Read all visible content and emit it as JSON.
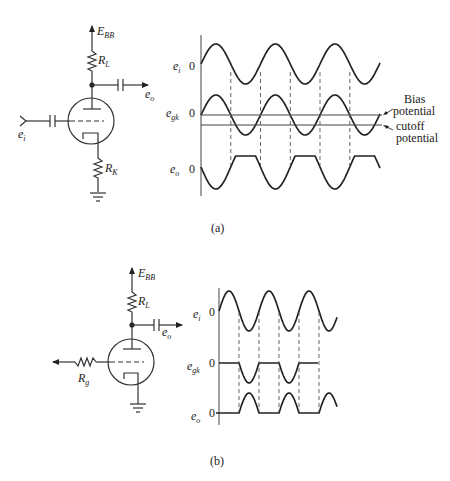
{
  "figure": {
    "panels": [
      {
        "id": "a",
        "caption": "(a)",
        "circuit": {
          "supply_label": "E",
          "supply_sub": "BB",
          "load_resistor": "R",
          "load_sub": "L",
          "cathode_resistor": "R",
          "cathode_sub": "K",
          "input_label": "e",
          "input_sub": "i",
          "output_label": "e",
          "output_sub": "o"
        },
        "waveforms": {
          "rows": [
            {
              "name": "e",
              "sub": "i",
              "zero": "0"
            },
            {
              "name": "e",
              "sub": "gk",
              "zero": "0"
            },
            {
              "name": "e",
              "sub": "o",
              "zero": "0"
            }
          ],
          "annotations": {
            "bias_line1": "Bias",
            "bias_line2": "potential",
            "cutoff_line1": "cutoff",
            "cutoff_line2": "potential"
          }
        }
      },
      {
        "id": "b",
        "caption": "(b)",
        "circuit": {
          "supply_label": "E",
          "supply_sub": "BB",
          "load_resistor": "R",
          "load_sub": "L",
          "grid_resistor": "R",
          "grid_sub": "g",
          "output_label": "e",
          "output_sub": "o"
        },
        "waveforms": {
          "rows": [
            {
              "name": "e",
              "sub": "i",
              "zero": "0"
            },
            {
              "name": "e",
              "sub": "gk",
              "zero": "0"
            },
            {
              "name": "e",
              "sub": "o",
              "zero": "0"
            }
          ]
        }
      }
    ]
  }
}
